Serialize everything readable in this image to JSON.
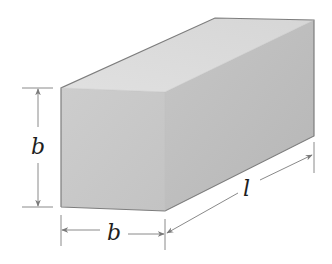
{
  "figure": {
    "shape": "square-prism",
    "colors": {
      "background": "#ffffff",
      "front_face": "#c9c9c9",
      "top_face": "#dcdcdc",
      "side_face": "#bcbcbc",
      "edge": "#7d7d7d",
      "dimension_line": "#8a8a8a",
      "label": "#1e1e1e"
    },
    "dimensions": {
      "height": {
        "label": "b",
        "orientation": "vertical",
        "side": "left"
      },
      "width": {
        "label": "b",
        "orientation": "horizontal",
        "side": "bottom"
      },
      "length": {
        "label": "l",
        "orientation": "diagonal",
        "side": "bottom-right"
      }
    }
  }
}
